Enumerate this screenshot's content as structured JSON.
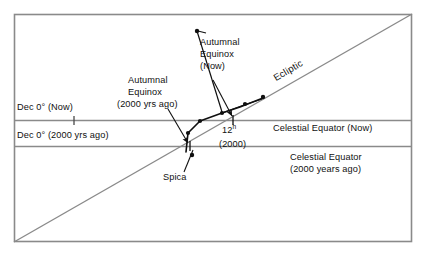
{
  "figure": {
    "type": "astronomy-diagram",
    "title_text": "",
    "frame": {
      "x": 14,
      "y": 14,
      "width": 398,
      "height": 228,
      "stroke": "#8a8a8a"
    },
    "background": "#ffffff",
    "line_color": "#808080",
    "curve_color": "#101010"
  },
  "labels": {
    "dec_now": "Dec 0° (Now)",
    "dec_2000": "Dec 0° (2000 yrs ago)",
    "celestial_equator_now": "Celestial Equator (Now)",
    "celestial_equator_2000_line1": "Celestial Equator",
    "celestial_equator_2000_line2": "(2000 years ago)",
    "ecliptic": "Ecliptic",
    "autumnal_now_line1": "Autumnal",
    "autumnal_now_line2": "Equinox",
    "autumnal_now_line3": "(Now)",
    "autumnal_2000_line1": "Autumnal",
    "autumnal_2000_line2": "Equinox",
    "autumnal_2000_line3": "(2000 yrs ago)",
    "hour_12_main": "12",
    "hour_12_sup": "h",
    "hour_12_year": "(2000)",
    "spica": "Spica"
  },
  "geometry": {
    "horizontal_lines": [
      {
        "name": "dec-zero-now-line",
        "y": 120,
        "x1": 14,
        "x2": 412
      },
      {
        "name": "dec-zero-2000-line",
        "y": 146,
        "x1": 14,
        "x2": 412
      }
    ],
    "ecliptic_line": {
      "x1": 14,
      "y1": 242,
      "x2": 412,
      "y2": 14
    },
    "tick_marks": [
      {
        "name": "tick-dec-now",
        "x": 74,
        "y": 120
      },
      {
        "name": "tick-12h-2000",
        "x": 233,
        "y": 120
      },
      {
        "name": "tick-equinox-2000",
        "x": 190,
        "y": 146
      }
    ],
    "precession_track": "M 183,152 L 188,133 L 200,121 L 222,113 L 240,107 L 263,98",
    "track_points": [
      {
        "name": "point-spica",
        "x": 190,
        "y": 155
      },
      {
        "name": "point-track-1",
        "x": 188,
        "y": 133
      },
      {
        "name": "point-track-2",
        "x": 200,
        "y": 121
      },
      {
        "name": "point-track-3",
        "x": 222,
        "y": 113
      },
      {
        "name": "point-track-4",
        "x": 240,
        "y": 107
      },
      {
        "name": "point-autumnal-now",
        "x": 263,
        "y": 98
      }
    ],
    "arrow_autumnal_2000": {
      "x1": 170,
      "y1": 110,
      "x2": 188,
      "y2": 144
    },
    "arrow_autumnal_now": {
      "x1": 215,
      "y1": 78,
      "x2": 233,
      "y2": 118
    },
    "leader_equinox_now_dot": {
      "x1": 205,
      "y1": 32,
      "x2": 190,
      "y2": 118
    },
    "leader_spica": {
      "x1": 185,
      "y1": 172,
      "x2": 193,
      "y2": 150
    }
  }
}
